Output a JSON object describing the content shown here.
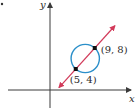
{
  "diagram": {
    "axes": {
      "x_label": "x",
      "y_label": "y"
    },
    "circle": {
      "color": "#2b8fc9",
      "diameter_endpoints": [
        [
          5,
          4
        ],
        [
          9,
          8
        ]
      ]
    },
    "line": {
      "color": "#d23a5a",
      "passes_through": [
        [
          5,
          4
        ],
        [
          9,
          8
        ]
      ]
    },
    "points": [
      {
        "x": 5,
        "y": 4,
        "label": "(5, 4)"
      },
      {
        "x": 9,
        "y": 8,
        "label": "(9, 8)"
      }
    ],
    "axis_color": "#3a3a3a",
    "point_color": "#111111"
  }
}
